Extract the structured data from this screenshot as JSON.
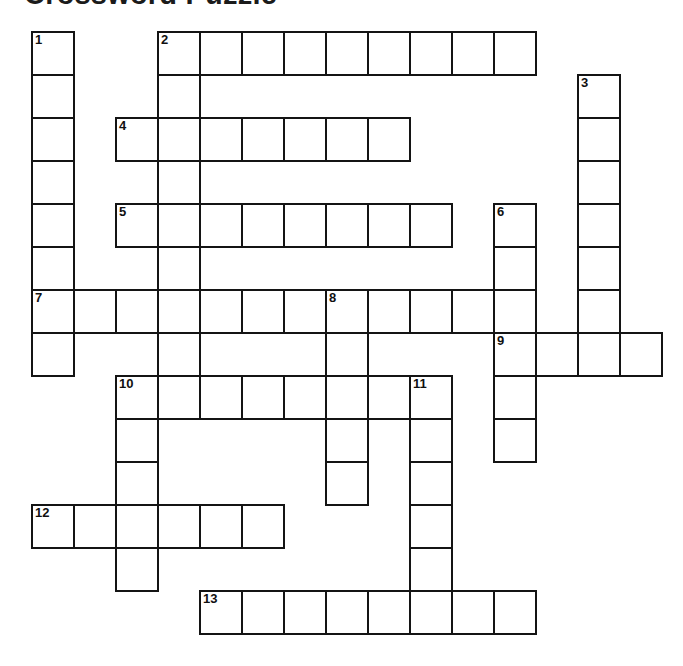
{
  "title": "Crossword Puzzle",
  "grid": {
    "origin_x": 31,
    "origin_y": 31,
    "cell_w": 42,
    "cell_h": 43,
    "columns": 15,
    "rows": 15,
    "border_color": "#141414",
    "cell_fill": "#ffffff",
    "background": "#ffffff"
  },
  "entries": [
    {
      "number": 1,
      "direction": "down",
      "col": 0,
      "row": 0,
      "length": 8
    },
    {
      "number": 2,
      "direction": "across",
      "col": 3,
      "row": 0,
      "length": 9
    },
    {
      "number": 2,
      "direction": "down",
      "col": 3,
      "row": 0,
      "length": 9
    },
    {
      "number": 3,
      "direction": "down",
      "col": 13,
      "row": 1,
      "length": 7
    },
    {
      "number": 4,
      "direction": "across",
      "col": 2,
      "row": 2,
      "length": 7
    },
    {
      "number": 5,
      "direction": "across",
      "col": 2,
      "row": 4,
      "length": 8
    },
    {
      "number": 6,
      "direction": "down",
      "col": 11,
      "row": 4,
      "length": 6
    },
    {
      "number": 7,
      "direction": "across",
      "col": 0,
      "row": 6,
      "length": 12
    },
    {
      "number": 8,
      "direction": "down",
      "col": 7,
      "row": 6,
      "length": 5
    },
    {
      "number": 9,
      "direction": "across",
      "col": 11,
      "row": 7,
      "length": 4
    },
    {
      "number": 10,
      "direction": "across",
      "col": 2,
      "row": 8,
      "length": 7
    },
    {
      "number": 10,
      "direction": "down",
      "col": 2,
      "row": 8,
      "length": 5
    },
    {
      "number": 11,
      "direction": "down",
      "col": 9,
      "row": 8,
      "length": 6
    },
    {
      "number": 12,
      "direction": "across",
      "col": 0,
      "row": 11,
      "length": 6
    },
    {
      "number": 13,
      "direction": "across",
      "col": 4,
      "row": 13,
      "length": 8
    }
  ],
  "numbered_cells": [
    {
      "number": 1,
      "col": 0,
      "row": 0
    },
    {
      "number": 2,
      "col": 3,
      "row": 0
    },
    {
      "number": 3,
      "col": 13,
      "row": 1
    },
    {
      "number": 4,
      "col": 2,
      "row": 2
    },
    {
      "number": 5,
      "col": 2,
      "row": 4
    },
    {
      "number": 6,
      "col": 11,
      "row": 4
    },
    {
      "number": 7,
      "col": 0,
      "row": 6
    },
    {
      "number": 8,
      "col": 7,
      "row": 6
    },
    {
      "number": 9,
      "col": 11,
      "row": 7
    },
    {
      "number": 10,
      "col": 2,
      "row": 8
    },
    {
      "number": 11,
      "col": 9,
      "row": 8
    },
    {
      "number": 12,
      "col": 0,
      "row": 11
    },
    {
      "number": 13,
      "col": 4,
      "row": 13
    }
  ],
  "letters": []
}
